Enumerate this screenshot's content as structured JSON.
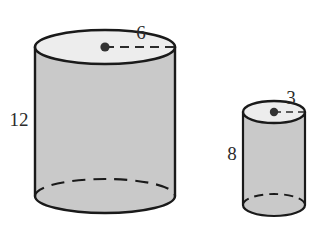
{
  "figure": {
    "background_color": "#ffffff",
    "outline_color": "#1a1a1a",
    "body_fill_color": "#c9c9c9",
    "top_face_fill_color": "#ededed",
    "label_color": "#2b2b2b",
    "center_dot_color": "#333333"
  },
  "shapes": [
    {
      "name": "large-cylinder",
      "kind": "cylinder",
      "radius_label": "6",
      "height_label": "12",
      "radius_value": 6,
      "height_value": 12,
      "radius_units": "",
      "height_units": "",
      "geometry": {
        "center_x": 105,
        "top_center_y": 47,
        "bottom_center_y": 196,
        "rx": 70,
        "ry": 17
      }
    },
    {
      "name": "small-cylinder",
      "kind": "cylinder",
      "radius_label": "3",
      "height_label": "8",
      "radius_value": 3,
      "height_value": 8,
      "radius_units": "",
      "height_units": "",
      "geometry": {
        "center_x": 274,
        "top_center_y": 112,
        "bottom_center_y": 205,
        "rx": 31,
        "ry": 11
      }
    }
  ],
  "labels": {
    "large_radius": "6",
    "large_height": "12",
    "small_radius": "3",
    "small_height": "8"
  }
}
